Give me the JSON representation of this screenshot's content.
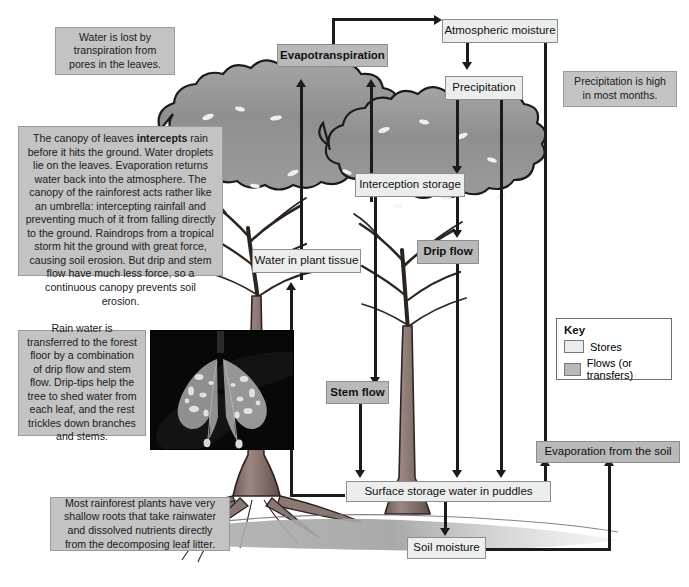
{
  "diagram": {
    "colors": {
      "store_fill": "#eceded",
      "flow_fill": "#b9b9b9",
      "note_fill": "#c3c3c3",
      "arrow": "#1b1b1b",
      "canopy": "#9a9a9a",
      "trunk": "#8a7670",
      "ground": "#a9a9a9"
    }
  },
  "boxes": {
    "evapotranspiration": {
      "label": "Evapotranspiration",
      "kind": "flow"
    },
    "atmospheric_moisture": {
      "label": "Atmospheric moisture",
      "kind": "store"
    },
    "precipitation": {
      "label": "Precipitation",
      "kind": "store"
    },
    "interception_storage": {
      "label": "Interception storage",
      "kind": "store"
    },
    "drip_flow": {
      "label": "Drip flow",
      "kind": "flow"
    },
    "water_in_plant_tissue": {
      "label": "Water in plant tissue",
      "kind": "store"
    },
    "stem_flow": {
      "label": "Stem flow",
      "kind": "flow"
    },
    "surface_storage": {
      "label": "Surface storage water in puddles",
      "kind": "store"
    },
    "soil_moisture": {
      "label": "Soil moisture",
      "kind": "store"
    },
    "evaporation_from_soil": {
      "label": "Evaporation from the soil",
      "kind": "flow"
    }
  },
  "notes": {
    "transpiration": "Water is lost by transpiration from pores in the leaves.",
    "precipitation_high": "Precipitation is high in most months.",
    "canopy": {
      "part1": "The canopy of leaves ",
      "emphasis": "intercepts",
      "part2": " rain before it hits the ground. Water droplets lie on the leaves. Evaporation returns water back into the atmosphere. The canopy of the rainforest acts rather like an umbrella: intercepting rainfall and preventing much of it from falling directly to the ground. Raindrops from a tropical storm hit the ground with great force, causing soil erosion. But drip and stem flow have much less force, so a continuous canopy prevents soil erosion."
    },
    "drip_tips": "Rain water is transferred to the forest floor by a combination of drip flow and stem flow. Drip-tips help the tree to shed water from each leaf, and the rest trickles down branches and stems.",
    "roots": "Most rainforest plants have very shallow roots that take rainwater and dissolved nutrients directly from the decomposing leaf litter."
  },
  "key": {
    "title": "Key",
    "items": [
      {
        "label": "Stores",
        "kind": "store"
      },
      {
        "label": "Flows (or transfers)",
        "kind": "flow"
      }
    ]
  },
  "photo": {
    "caption": "Photograph of two leaves with drip-tips covered in water droplets"
  }
}
